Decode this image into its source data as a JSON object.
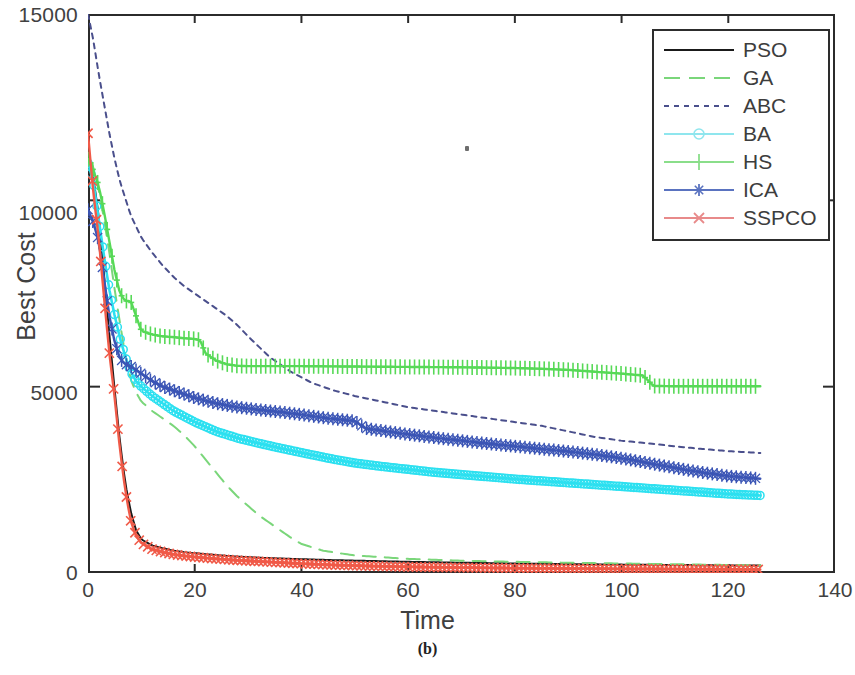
{
  "caption": "(b)",
  "axes": {
    "xlabel": "Time",
    "ylabel": "Best Cost",
    "xticks": [
      "0",
      "20",
      "40",
      "60",
      "80",
      "100",
      "120",
      "140"
    ],
    "yticks": [
      "0",
      "5000",
      "10000",
      "15000"
    ]
  },
  "legend": {
    "items": [
      {
        "label": "PSO",
        "color": "#1a1a1a",
        "style": "solid",
        "marker": "none"
      },
      {
        "label": "GA",
        "color": "#7ad67a",
        "style": "dashed",
        "marker": "none"
      },
      {
        "label": "ABC",
        "color": "#4a4f8c",
        "style": "dotted",
        "marker": "none"
      },
      {
        "label": "BA",
        "color": "#8fe6ee",
        "style": "solid",
        "marker": "circle"
      },
      {
        "label": "HS",
        "color": "#8ade8a",
        "style": "solid",
        "marker": "plus"
      },
      {
        "label": "ICA",
        "color": "#5a73c0",
        "style": "solid",
        "marker": "star"
      },
      {
        "label": "SSPCO",
        "color": "#e88a8a",
        "style": "solid",
        "marker": "x"
      }
    ]
  },
  "chart_data": {
    "type": "line",
    "title": "",
    "xlabel": "Time",
    "ylabel": "Best Cost",
    "xlim": [
      0,
      140
    ],
    "ylim": [
      0,
      15000
    ],
    "xticks": [
      0,
      20,
      40,
      60,
      80,
      100,
      120,
      140
    ],
    "yticks": [
      0,
      5000,
      10000,
      15000
    ],
    "grid": false,
    "legend_position": "top-right",
    "x_data_end": 126,
    "series": [
      {
        "name": "PSO",
        "color": "#1a1a1a",
        "style": "solid",
        "marker": "none",
        "x": [
          0,
          1,
          2,
          3,
          4,
          5,
          6,
          7,
          8,
          9,
          10,
          12,
          14,
          16,
          18,
          20,
          24,
          28,
          32,
          36,
          40,
          46,
          52,
          60,
          70,
          80,
          90,
          100,
          110,
          120,
          126
        ],
        "values": [
          11200,
          10600,
          9600,
          8000,
          6400,
          4900,
          3500,
          2400,
          1650,
          1150,
          900,
          740,
          660,
          600,
          560,
          530,
          480,
          440,
          410,
          390,
          370,
          345,
          325,
          300,
          275,
          255,
          240,
          225,
          215,
          205,
          200
        ]
      },
      {
        "name": "GA",
        "color": "#7ad67a",
        "style": "dashed",
        "marker": "none",
        "x": [
          0,
          1,
          2,
          3,
          4,
          5,
          6,
          7,
          8,
          9,
          10,
          12,
          14,
          16,
          18,
          20,
          22,
          24,
          26,
          28,
          30,
          32,
          34,
          36,
          38,
          40,
          44,
          50,
          60,
          70,
          80,
          90,
          100,
          110,
          120,
          126
        ],
        "values": [
          11100,
          10900,
          10300,
          9500,
          8600,
          7600,
          6700,
          5850,
          5200,
          4850,
          4600,
          4350,
          4150,
          3950,
          3700,
          3400,
          3050,
          2700,
          2350,
          2050,
          1800,
          1550,
          1350,
          1150,
          950,
          780,
          600,
          470,
          380,
          330,
          300,
          275,
          255,
          235,
          215,
          205
        ]
      },
      {
        "name": "ABC",
        "color": "#4a4f8c",
        "style": "dotted",
        "marker": "none",
        "x": [
          0,
          1,
          2,
          3,
          4,
          5,
          6,
          8,
          10,
          12,
          14,
          16,
          18,
          20,
          22,
          24,
          26,
          28,
          30,
          34,
          38,
          42,
          46,
          50,
          55,
          60,
          65,
          70,
          75,
          80,
          85,
          90,
          95,
          100,
          105,
          110,
          115,
          120,
          126
        ],
        "values": [
          15000,
          14300,
          13400,
          12600,
          11800,
          11100,
          10500,
          9600,
          9000,
          8600,
          8250,
          7950,
          7700,
          7500,
          7300,
          7100,
          6900,
          6650,
          6350,
          5800,
          5400,
          5100,
          4900,
          4750,
          4600,
          4450,
          4350,
          4250,
          4150,
          4050,
          3950,
          3800,
          3650,
          3550,
          3480,
          3400,
          3330,
          3270,
          3220
        ]
      },
      {
        "name": "BA",
        "color": "#2ce0f0",
        "style": "solid",
        "marker": "circle",
        "x": [
          0,
          1,
          2,
          3,
          4,
          5,
          6,
          7,
          8,
          9,
          10,
          12,
          14,
          16,
          18,
          20,
          24,
          28,
          32,
          36,
          40,
          45,
          50,
          55,
          60,
          65,
          70,
          75,
          80,
          85,
          90,
          95,
          100,
          105,
          110,
          115,
          120,
          126
        ],
        "values": [
          11000,
          10500,
          9500,
          8500,
          7600,
          6900,
          6300,
          5800,
          5400,
          5150,
          5000,
          4750,
          4550,
          4350,
          4200,
          4050,
          3800,
          3620,
          3480,
          3350,
          3230,
          3080,
          2950,
          2860,
          2780,
          2700,
          2640,
          2580,
          2520,
          2470,
          2420,
          2370,
          2320,
          2270,
          2220,
          2170,
          2120,
          2080
        ]
      },
      {
        "name": "HS",
        "color": "#57d957",
        "style": "solid",
        "marker": "plus",
        "x": [
          0,
          1,
          2,
          3,
          4,
          5,
          6,
          7,
          8,
          10,
          12,
          14,
          16,
          18,
          20,
          21,
          22,
          24,
          26,
          28,
          30,
          40,
          50,
          60,
          70,
          80,
          85,
          90,
          95,
          100,
          104,
          106,
          110,
          115,
          120,
          126
        ],
        "values": [
          11100,
          10800,
          10400,
          9700,
          8900,
          8100,
          7500,
          7300,
          7300,
          6500,
          6400,
          6350,
          6330,
          6300,
          6280,
          6250,
          5900,
          5700,
          5600,
          5560,
          5550,
          5550,
          5540,
          5530,
          5520,
          5500,
          5480,
          5450,
          5400,
          5350,
          5300,
          5020,
          5010,
          5010,
          5010,
          5010
        ]
      },
      {
        "name": "ICA",
        "color": "#3b55b5",
        "style": "solid",
        "marker": "star",
        "x": [
          0,
          1,
          2,
          3,
          4,
          5,
          6,
          7,
          8,
          9,
          10,
          12,
          14,
          16,
          18,
          20,
          24,
          28,
          32,
          36,
          40,
          45,
          50,
          52,
          56,
          60,
          65,
          70,
          75,
          80,
          85,
          90,
          95,
          100,
          105,
          110,
          115,
          120,
          126
        ],
        "values": [
          9750,
          9400,
          8900,
          7900,
          6900,
          6200,
          5750,
          5600,
          5550,
          5450,
          5350,
          5150,
          5000,
          4900,
          4800,
          4700,
          4550,
          4450,
          4380,
          4320,
          4250,
          4150,
          4080,
          3880,
          3800,
          3720,
          3630,
          3550,
          3470,
          3400,
          3330,
          3260,
          3180,
          3080,
          2950,
          2820,
          2700,
          2600,
          2530
        ]
      },
      {
        "name": "SSPCO",
        "color": "#f05a48",
        "style": "solid",
        "marker": "x",
        "x": [
          0,
          1,
          2,
          3,
          4,
          5,
          6,
          7,
          8,
          9,
          10,
          12,
          14,
          16,
          18,
          20,
          24,
          28,
          32,
          36,
          40,
          46,
          52,
          60,
          70,
          80,
          90,
          100,
          110,
          120,
          126
        ],
        "values": [
          11800,
          10200,
          9000,
          7400,
          5900,
          4700,
          3300,
          2200,
          1400,
          1000,
          800,
          640,
          560,
          500,
          460,
          430,
          380,
          340,
          310,
          280,
          250,
          215,
          190,
          165,
          145,
          130,
          120,
          110,
          105,
          100,
          95
        ]
      }
    ]
  }
}
